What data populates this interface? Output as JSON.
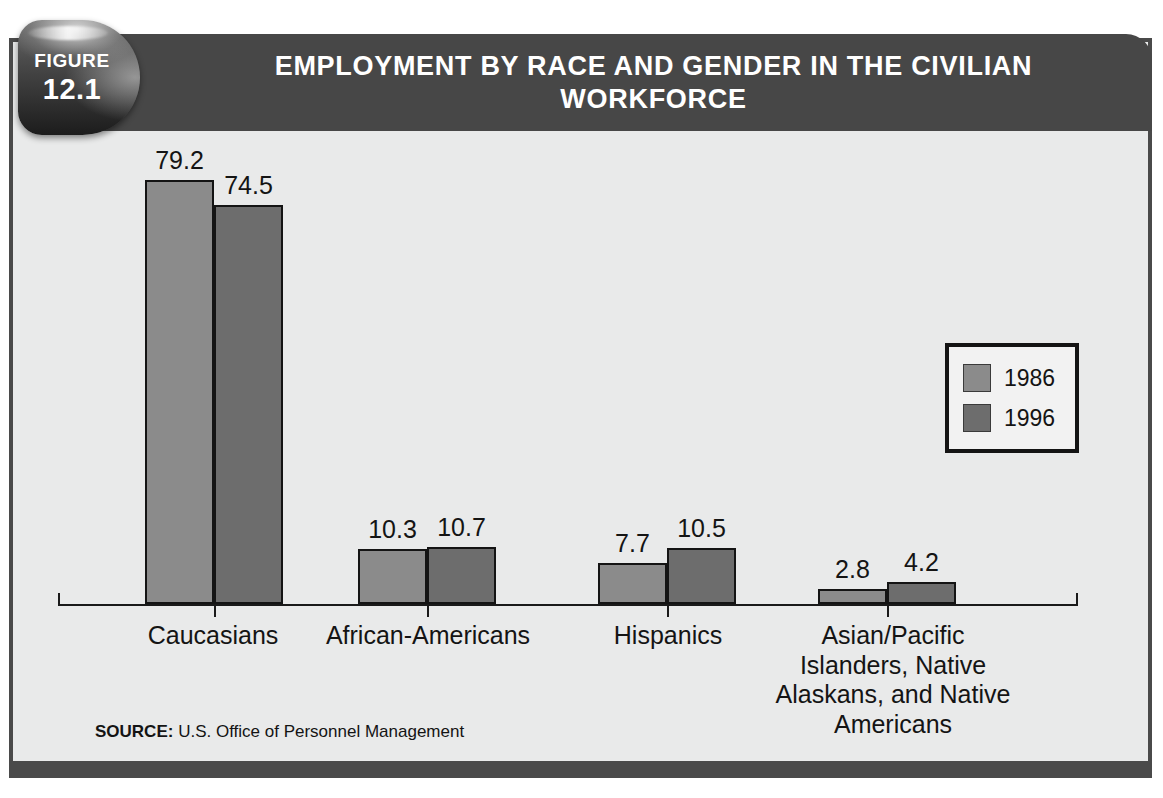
{
  "figure": {
    "badge_word": "FIGURE",
    "badge_number": "12.1",
    "title": "EMPLOYMENT BY RACE AND GENDER IN THE CIVILIAN WORKFORCE",
    "source_label": "SOURCE:",
    "source_text": " U.S. Office of Personnel Management"
  },
  "legend": {
    "items": [
      {
        "label": "1986",
        "color": "#8b8b8b"
      },
      {
        "label": "1996",
        "color": "#6d6d6d"
      }
    ]
  },
  "chart_data": {
    "type": "bar",
    "title": "EMPLOYMENT BY RACE AND GENDER IN THE CIVILIAN WORKFORCE",
    "subtitle": "",
    "xlabel": "",
    "ylabel": "",
    "ylim": [
      0,
      85
    ],
    "grid": false,
    "legend_position": "top-right",
    "categories": [
      "Caucasians",
      "African-Americans",
      "Hispanics",
      "Asian/Pacific Islanders, Native Alaskans, and Native Americans"
    ],
    "series": [
      {
        "name": "1986",
        "color": "#8b8b8b",
        "values": [
          79.2,
          10.3,
          7.7,
          2.8
        ]
      },
      {
        "name": "1996",
        "color": "#6d6d6d",
        "values": [
          74.5,
          10.7,
          10.5,
          4.2
        ]
      }
    ],
    "value_labels": [
      [
        "79.2",
        "74.5"
      ],
      [
        "10.3",
        "10.7"
      ],
      [
        "7.7",
        "10.5"
      ],
      [
        "2.8",
        "4.2"
      ]
    ],
    "category_label_lines": [
      [
        "Caucasians"
      ],
      [
        "African-Americans"
      ],
      [
        "Hispanics"
      ],
      [
        "Asian/Pacific",
        "Islanders, Native",
        "Alaskans, and Native",
        "Americans"
      ]
    ],
    "source": "SOURCE: U.S. Office of Personnel Management"
  }
}
